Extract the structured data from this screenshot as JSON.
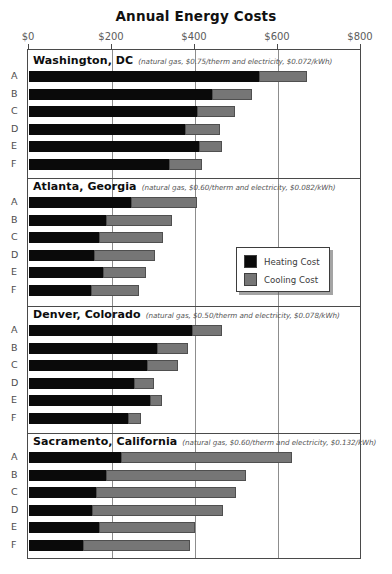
{
  "chart_data": {
    "type": "bar",
    "title": "Annual Energy Costs",
    "xlabel": "",
    "ylabel": "",
    "orientation": "horizontal",
    "stacked": true,
    "xlim": [
      0,
      800
    ],
    "xticks": [
      0,
      200,
      400,
      600,
      800
    ],
    "xticklabels": [
      "$0",
      "$200",
      "$400",
      "$600",
      "$800"
    ],
    "grid": true,
    "legend_position": "center-right",
    "series": [
      {
        "name": "Heating Cost",
        "color": "#0a0a0a"
      },
      {
        "name": "Cooling Cost",
        "color": "#767676"
      }
    ],
    "categories": [
      "A",
      "B",
      "C",
      "D",
      "E",
      "F"
    ],
    "groups": [
      {
        "city": "Washington, DC",
        "rates": "(natural gas, $0.75/therm and electricity, $0.072/kWh)",
        "rows": [
          {
            "label": "A",
            "heating": 555,
            "cooling": 115,
            "total": 670
          },
          {
            "label": "B",
            "heating": 442,
            "cooling": 96,
            "total": 538
          },
          {
            "label": "C",
            "heating": 406,
            "cooling": 91,
            "total": 497
          },
          {
            "label": "D",
            "heating": 376,
            "cooling": 85,
            "total": 461
          },
          {
            "label": "E",
            "heating": 409,
            "cooling": 55,
            "total": 464
          },
          {
            "label": "F",
            "heating": 338,
            "cooling": 78,
            "total": 416
          }
        ]
      },
      {
        "city": "Atlanta, Georgia",
        "rates": "(natural gas, $0.60/therm and electricity, $0.082/kWh)",
        "rows": [
          {
            "label": "A",
            "heating": 246,
            "cooling": 160,
            "total": 406
          },
          {
            "label": "B",
            "heating": 186,
            "cooling": 158,
            "total": 344
          },
          {
            "label": "C",
            "heating": 168,
            "cooling": 154,
            "total": 322
          },
          {
            "label": "D",
            "heating": 156,
            "cooling": 148,
            "total": 304
          },
          {
            "label": "E",
            "heating": 178,
            "cooling": 103,
            "total": 281
          },
          {
            "label": "F",
            "heating": 149,
            "cooling": 117,
            "total": 266
          }
        ]
      },
      {
        "city": "Denver, Colorado",
        "rates": "(natural gas, $0.50/therm and electricity, $0.078/kWh)",
        "rows": [
          {
            "label": "A",
            "heating": 392,
            "cooling": 73,
            "total": 465
          },
          {
            "label": "B",
            "heating": 308,
            "cooling": 75,
            "total": 383
          },
          {
            "label": "C",
            "heating": 284,
            "cooling": 75,
            "total": 359
          },
          {
            "label": "D",
            "heating": 253,
            "cooling": 48,
            "total": 301
          },
          {
            "label": "E",
            "heating": 292,
            "cooling": 29,
            "total": 321
          },
          {
            "label": "F",
            "heating": 238,
            "cooling": 32,
            "total": 270
          }
        ]
      },
      {
        "city": "Sacramento, California",
        "rates": "(natural gas, $0.60/therm and electricity, $0.132/kWh)",
        "rows": [
          {
            "label": "A",
            "heating": 222,
            "cooling": 411,
            "total": 633
          },
          {
            "label": "B",
            "heating": 186,
            "cooling": 338,
            "total": 524
          },
          {
            "label": "C",
            "heating": 162,
            "cooling": 336,
            "total": 498
          },
          {
            "label": "D",
            "heating": 152,
            "cooling": 316,
            "total": 468
          },
          {
            "label": "E",
            "heating": 168,
            "cooling": 233,
            "total": 401
          },
          {
            "label": "F",
            "heating": 129,
            "cooling": 258,
            "total": 387
          }
        ]
      }
    ]
  }
}
